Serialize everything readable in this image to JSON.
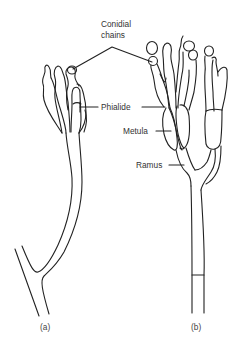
{
  "diagram": {
    "labels": {
      "conidial_chains_line1": "Conidial",
      "conidial_chains_line2": "chains",
      "phialide": "Phialide",
      "metula": "Metula",
      "ramus": "Ramus"
    },
    "captions": {
      "left": "(a)",
      "right": "(b)"
    },
    "colors": {
      "line": "#222222",
      "text": "#333333",
      "background": "#ffffff"
    }
  }
}
